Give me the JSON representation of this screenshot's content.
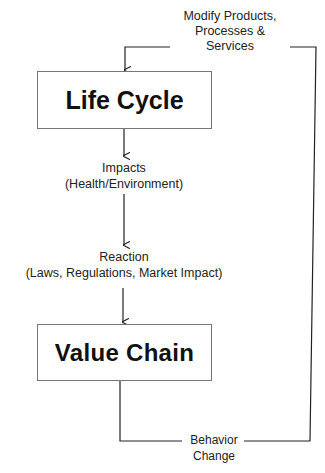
{
  "nodes": {
    "life_cycle": "Life Cycle",
    "value_chain": "Value Chain"
  },
  "labels": {
    "modify": [
      "Modify Products,",
      "Processes &",
      "Services"
    ],
    "impacts": [
      "Impacts",
      "(Health/Environment)"
    ],
    "reaction": [
      "Reaction",
      "(Laws, Regulations, Market Impact)"
    ],
    "behavior": [
      "Behavior",
      "Change"
    ]
  },
  "colors": {
    "line": "#222222",
    "box_border": "#777777",
    "text": "#111111"
  }
}
